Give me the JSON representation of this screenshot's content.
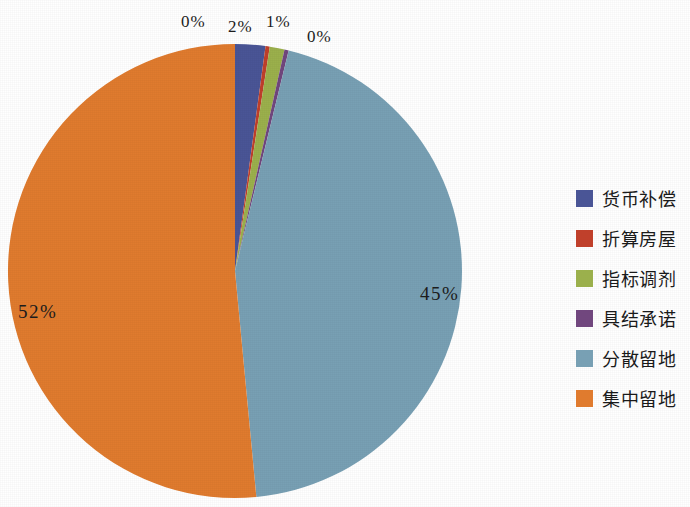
{
  "chart_data": {
    "type": "pie",
    "title": "",
    "categories": [
      "货币补偿",
      "折算房屋",
      "指标调剂",
      "具结承诺",
      "分散留地",
      "集中留地"
    ],
    "values": [
      2,
      0,
      1,
      0,
      45,
      52
    ],
    "value_labels": [
      "2%",
      "0%",
      "1%",
      "0%",
      "45%",
      "52%"
    ],
    "colors": [
      "#4A5596",
      "#C0402B",
      "#9BB04C",
      "#71477E",
      "#78A0B4",
      "#E07B2E"
    ],
    "legend_position": "right",
    "start_angle_deg": 0,
    "direction": "clockwise",
    "grid": false,
    "xlabel": "",
    "ylabel": ""
  },
  "labels": {
    "pct_huobibuchang": "2%",
    "pct_zhesuanfangwu": "0%",
    "pct_zhibiaotiaoji": "1%",
    "pct_jujiechengnuo": "0%",
    "pct_fensanliudi": "45%",
    "pct_jizhongliudi": "52%"
  },
  "legend": {
    "items": [
      {
        "label": "货币补偿",
        "color": "#4A5596"
      },
      {
        "label": "折算房屋",
        "color": "#C0402B"
      },
      {
        "label": "指标调剂",
        "color": "#9BB04C"
      },
      {
        "label": "具结承诺",
        "color": "#71477E"
      },
      {
        "label": "分散留地",
        "color": "#78A0B4"
      },
      {
        "label": "集中留地",
        "color": "#E07B2E"
      }
    ]
  }
}
